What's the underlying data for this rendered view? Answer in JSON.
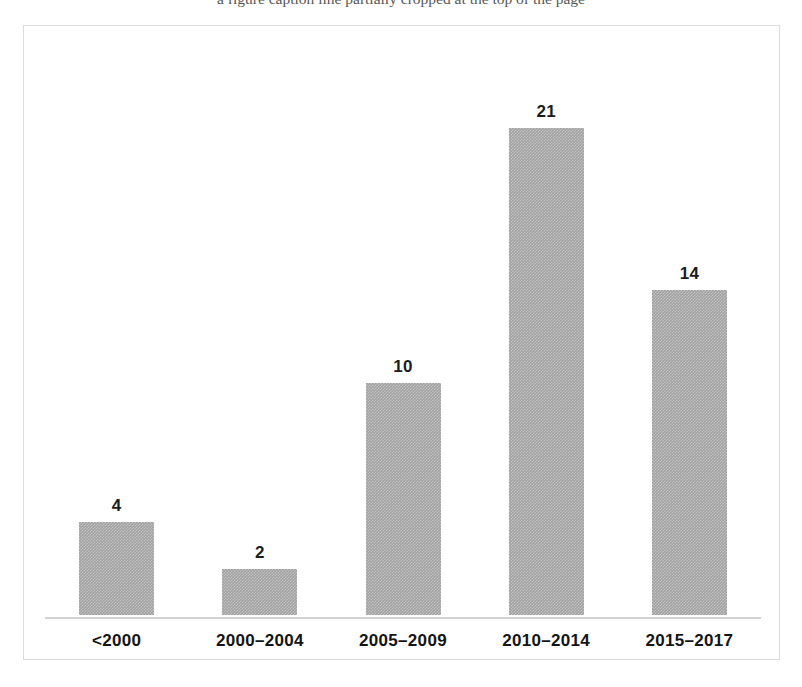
{
  "figure": {
    "cut_caption": "a figure caption line partially cropped at the top of the page"
  },
  "chart_data": {
    "type": "bar",
    "title": "",
    "subtitle": "",
    "xlabel": "",
    "ylabel": "",
    "categories": [
      "<2000",
      "2000–2004",
      "2005–2009",
      "2010–2014",
      "2015–2017"
    ],
    "values": [
      4,
      2,
      10,
      21,
      14
    ],
    "value_labels": [
      "4",
      "2",
      "10",
      "21",
      "14"
    ],
    "series": [
      {
        "name": "",
        "values": [
          4,
          2,
          10,
          21,
          14
        ]
      }
    ],
    "ylim": [
      0,
      21
    ],
    "grid": false,
    "legend": false,
    "legend_position": "none",
    "axis_visible": {
      "x_axis_line": true,
      "y_axis_line": false,
      "x_tick_labels": true,
      "y_tick_labels": false
    },
    "data_labels_shown": true,
    "colors": {
      "bar_fill": "#a2a2a2",
      "frame_border": "#dcdcdc",
      "axis_line": "#d2d2d2",
      "label_text": "#141414",
      "value_text": "#1c1c1c",
      "background": "#ffffff"
    }
  }
}
